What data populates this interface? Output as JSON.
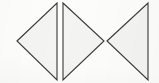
{
  "figure": {
    "width": 159,
    "height": 83,
    "background_color": "#fdfdfc",
    "stroke_color": "#38383a",
    "stroke_width": 1.1,
    "fill_color": "#f4f4f2",
    "shapes": [
      {
        "name": "triangle-left-1",
        "direction": "left",
        "points": "17,41 57,3 57,80",
        "apex": {
          "x": 17,
          "y": 41
        },
        "base_x": 57,
        "base_top_y": 3,
        "base_bottom_y": 80,
        "fill": "#f4f4f2",
        "stroke": "#38383a"
      },
      {
        "name": "triangle-right-2",
        "direction": "right",
        "points": "63,3 104,41 63,80",
        "apex": {
          "x": 104,
          "y": 41
        },
        "base_x": 63,
        "base_top_y": 3,
        "base_bottom_y": 80,
        "fill": "#f4f4f2",
        "stroke": "#38383a"
      },
      {
        "name": "triangle-left-3",
        "direction": "left",
        "points": "107,41 148,3 148,80",
        "apex": {
          "x": 107,
          "y": 41
        },
        "base_x": 148,
        "base_top_y": 3,
        "base_bottom_y": 80,
        "fill": "#f4f4f2",
        "stroke": "#38383a"
      }
    ],
    "labels": []
  }
}
